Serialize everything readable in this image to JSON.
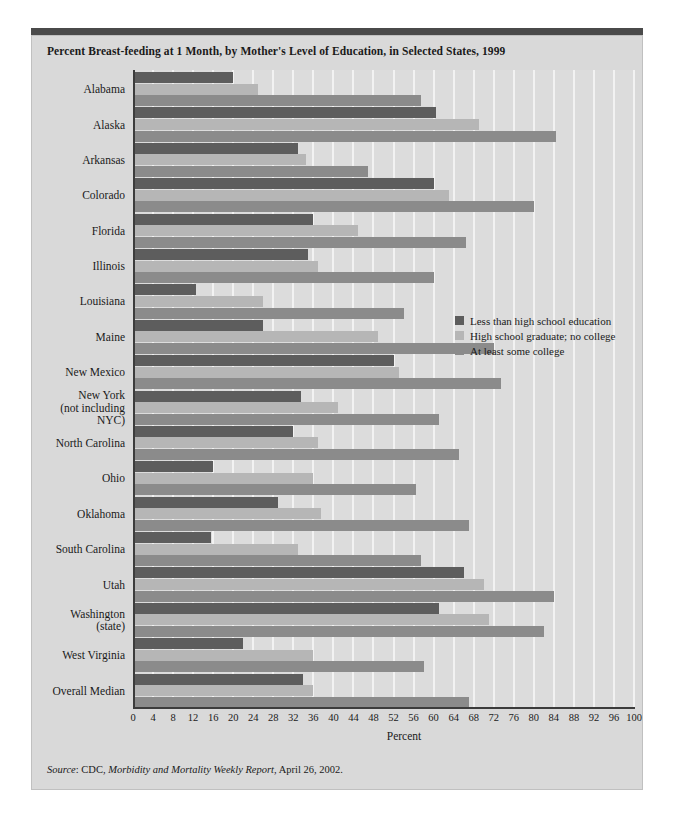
{
  "chart_data": {
    "type": "bar",
    "orientation": "horizontal",
    "title": "Percent Breast-feeding at 1 Month, by Mother's Level of Education, in Selected States, 1999",
    "xlabel": "Percent",
    "ylabel": "",
    "xlim": [
      0,
      100
    ],
    "xticks": [
      0,
      4,
      8,
      12,
      16,
      20,
      24,
      28,
      32,
      36,
      40,
      44,
      48,
      52,
      56,
      60,
      64,
      68,
      72,
      76,
      80,
      84,
      88,
      92,
      96,
      100
    ],
    "grid": true,
    "legend_position": "center-right",
    "categories": [
      "Alabama",
      "Alaska",
      "Arkansas",
      "Colorado",
      "Florida",
      "Illinois",
      "Louisiana",
      "Maine",
      "New Mexico",
      "New York\n(not including\nNYC)",
      "North Carolina",
      "Ohio",
      "Oklahoma",
      "South Carolina",
      "Utah",
      "Washington\n(state)",
      "West Virginia",
      "Overall Median"
    ],
    "series": [
      {
        "name": "Less than high school education",
        "color": "#5d5d5d",
        "values": [
          20,
          60.5,
          33,
          60,
          36,
          35,
          12.5,
          26,
          52,
          33.5,
          32,
          16,
          29,
          15.5,
          66,
          61,
          22,
          34
        ]
      },
      {
        "name": "High school graduate; no college",
        "color": "#b6b6b6",
        "values": [
          25,
          69,
          34.5,
          63,
          45,
          37,
          26,
          49,
          53,
          41,
          37,
          36,
          37.5,
          33,
          70,
          71,
          36,
          36
        ]
      },
      {
        "name": "At least some college",
        "color": "#8b8b8b",
        "values": [
          57.5,
          84.5,
          47,
          80,
          66.5,
          60,
          54,
          72,
          73.5,
          61,
          65,
          56.5,
          67,
          57.5,
          84,
          82,
          58,
          67
        ]
      }
    ],
    "source": {
      "prefix": "Source",
      "text_a": ": CDC, ",
      "publication": "Morbidity and Mortality Weekly Report",
      "text_b": ", April 26, 2002."
    }
  }
}
